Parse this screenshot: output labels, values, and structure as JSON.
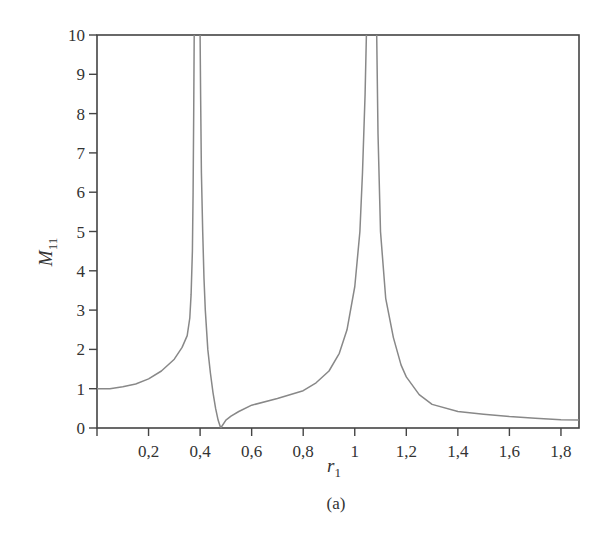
{
  "chart_data": {
    "type": "line",
    "title": "",
    "xlabel": "r_1",
    "ylabel": "M_11",
    "caption": "(a)",
    "xlim": [
      0,
      1.87
    ],
    "ylim": [
      0,
      10
    ],
    "grid": false,
    "legend": null,
    "x_ticks": [
      0.2,
      0.4,
      0.6,
      0.8,
      1.0,
      1.2,
      1.4,
      1.6,
      1.8
    ],
    "x_tick_labels": [
      "0,2",
      "0,4",
      "0,6",
      "0,8",
      "1",
      "1,2",
      "1,4",
      "1,6",
      "1,8"
    ],
    "y_ticks": [
      0,
      1,
      2,
      3,
      4,
      5,
      6,
      7,
      8,
      9,
      10
    ],
    "y_tick_labels": [
      "0",
      "1",
      "2",
      "3",
      "4",
      "5",
      "6",
      "7",
      "8",
      "9",
      "10"
    ],
    "line_color": "#888888",
    "series": [
      {
        "name": "M11",
        "segments": [
          {
            "x": [
              0,
              0.05,
              0.1,
              0.15,
              0.2,
              0.25,
              0.3,
              0.33,
              0.35,
              0.36,
              0.365,
              0.37,
              0.373,
              0.375,
              0.377
            ],
            "y": [
              1.0,
              1.0,
              1.05,
              1.12,
              1.25,
              1.45,
              1.75,
              2.05,
              2.35,
              2.8,
              3.4,
              4.5,
              6.0,
              8.0,
              10.0
            ]
          },
          {
            "x": [
              0.4,
              0.402,
              0.405,
              0.41,
              0.415,
              0.42,
              0.43,
              0.44,
              0.45,
              0.46,
              0.47,
              0.48
            ],
            "y": [
              10.0,
              8.5,
              6.5,
              5.0,
              3.8,
              3.0,
              2.0,
              1.4,
              0.9,
              0.5,
              0.2,
              0.0
            ]
          },
          {
            "x": [
              0.48,
              0.5,
              0.52,
              0.55,
              0.6,
              0.7,
              0.8,
              0.85,
              0.9,
              0.94,
              0.97,
              1.0,
              1.02,
              1.03,
              1.04,
              1.045
            ],
            "y": [
              0.0,
              0.2,
              0.3,
              0.42,
              0.58,
              0.75,
              0.95,
              1.15,
              1.45,
              1.9,
              2.5,
              3.6,
              5.0,
              6.5,
              8.5,
              10.0
            ]
          },
          {
            "x": [
              1.085,
              1.09,
              1.1,
              1.12,
              1.15,
              1.18,
              1.2,
              1.25,
              1.3,
              1.4,
              1.5,
              1.6,
              1.7,
              1.8,
              1.87
            ],
            "y": [
              10.0,
              7.5,
              5.0,
              3.3,
              2.3,
              1.6,
              1.3,
              0.85,
              0.6,
              0.42,
              0.35,
              0.29,
              0.25,
              0.21,
              0.2
            ]
          }
        ]
      }
    ]
  }
}
